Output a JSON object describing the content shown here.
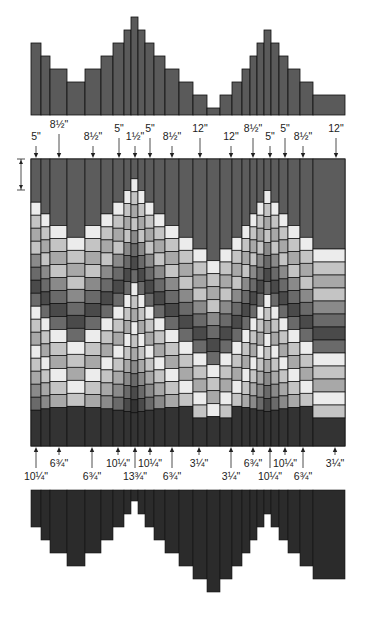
{
  "diagram": {
    "type": "quilt-strip-piecing-pattern",
    "colors": {
      "top_bars": "#5a5a5a",
      "bottom_bars": "#2b2b2b",
      "outline": "#111111",
      "shades": [
        "#ececec",
        "#c4c4c4",
        "#a8a8a8",
        "#8a8a8a",
        "#6a6a6a",
        "#4a4a4a",
        "#333333"
      ]
    },
    "columns": [
      {
        "x": 31,
        "w": 10
      },
      {
        "x": 41,
        "w": 9
      },
      {
        "x": 50,
        "w": 17
      },
      {
        "x": 67,
        "w": 18
      },
      {
        "x": 85,
        "w": 16
      },
      {
        "x": 101,
        "w": 12
      },
      {
        "x": 113,
        "w": 11
      },
      {
        "x": 124,
        "w": 7
      },
      {
        "x": 131,
        "w": 7
      },
      {
        "x": 138,
        "w": 7
      },
      {
        "x": 145,
        "w": 9
      },
      {
        "x": 154,
        "w": 11
      },
      {
        "x": 165,
        "w": 14
      },
      {
        "x": 179,
        "w": 14
      },
      {
        "x": 193,
        "w": 14
      },
      {
        "x": 207,
        "w": 13
      },
      {
        "x": 220,
        "w": 12
      },
      {
        "x": 232,
        "w": 10
      },
      {
        "x": 242,
        "w": 8
      },
      {
        "x": 250,
        "w": 7
      },
      {
        "x": 257,
        "w": 7
      },
      {
        "x": 264,
        "w": 7
      },
      {
        "x": 271,
        "w": 8
      },
      {
        "x": 279,
        "w": 9
      },
      {
        "x": 288,
        "w": 12
      },
      {
        "x": 300,
        "w": 13
      },
      {
        "x": 313,
        "w": 32
      }
    ],
    "top_bar_tops": [
      43,
      56,
      69,
      82,
      69,
      56,
      43,
      30,
      17,
      30,
      43,
      56,
      69,
      82,
      95,
      108,
      95,
      82,
      69,
      56,
      43,
      30,
      43,
      56,
      69,
      82,
      95
    ],
    "bottom_bar_bottoms": [
      527,
      540,
      553,
      566,
      553,
      540,
      527,
      514,
      501,
      514,
      527,
      540,
      553,
      566,
      579,
      592,
      579,
      566,
      553,
      540,
      527,
      514,
      527,
      540,
      553,
      566,
      579
    ],
    "top_labels": [
      {
        "text": "5\"",
        "x": 36,
        "y": 140,
        "arrow_x": 36,
        "arrow_top": 146
      },
      {
        "text": "8½\"",
        "x": 59,
        "y": 128,
        "arrow_x": 59,
        "arrow_top": 134
      },
      {
        "text": "8½\"",
        "x": 93,
        "y": 140,
        "arrow_x": 93,
        "arrow_top": 146
      },
      {
        "text": "5\"",
        "x": 119,
        "y": 132,
        "arrow_x": 119,
        "arrow_top": 138
      },
      {
        "text": "1½\"",
        "x": 135,
        "y": 140,
        "arrow_x": 135,
        "arrow_top": 146
      },
      {
        "text": "5\"",
        "x": 150,
        "y": 132,
        "arrow_x": 150,
        "arrow_top": 138
      },
      {
        "text": "8½\"",
        "x": 172,
        "y": 140,
        "arrow_x": 172,
        "arrow_top": 146
      },
      {
        "text": "12\"",
        "x": 200,
        "y": 132,
        "arrow_x": 200,
        "arrow_top": 138
      },
      {
        "text": "12\"",
        "x": 231,
        "y": 140,
        "arrow_x": 231,
        "arrow_top": 146
      },
      {
        "text": "8½\"",
        "x": 253,
        "y": 132,
        "arrow_x": 253,
        "arrow_top": 138
      },
      {
        "text": "5\"",
        "x": 270,
        "y": 140,
        "arrow_x": 270,
        "arrow_top": 146
      },
      {
        "text": "5\"",
        "x": 285,
        "y": 132,
        "arrow_x": 285,
        "arrow_top": 138
      },
      {
        "text": "8½\"",
        "x": 303,
        "y": 140,
        "arrow_x": 303,
        "arrow_top": 146
      },
      {
        "text": "12\"",
        "x": 336,
        "y": 132,
        "arrow_x": 336,
        "arrow_top": 138
      }
    ],
    "bottom_labels": [
      {
        "text": "10¼\"",
        "x": 36,
        "y": 480,
        "arrow_x": 36,
        "arrow_bottom": 455
      },
      {
        "text": "6¾\"",
        "x": 59,
        "y": 467,
        "arrow_x": 59,
        "arrow_bottom": 455
      },
      {
        "text": "6¾\"",
        "x": 92,
        "y": 480,
        "arrow_x": 92,
        "arrow_bottom": 455
      },
      {
        "text": "10¼\"",
        "x": 118,
        "y": 467,
        "arrow_x": 118,
        "arrow_bottom": 455
      },
      {
        "text": "13¾\"",
        "x": 135,
        "y": 480,
        "arrow_x": 135,
        "arrow_bottom": 455
      },
      {
        "text": "10¼\"",
        "x": 150,
        "y": 467,
        "arrow_x": 150,
        "arrow_bottom": 455
      },
      {
        "text": "6¾\"",
        "x": 172,
        "y": 480,
        "arrow_x": 172,
        "arrow_bottom": 455
      },
      {
        "text": "3¼\"",
        "x": 199,
        "y": 467,
        "arrow_x": 199,
        "arrow_bottom": 455
      },
      {
        "text": "3¼\"",
        "x": 231,
        "y": 480,
        "arrow_x": 231,
        "arrow_bottom": 455
      },
      {
        "text": "6¾\"",
        "x": 253,
        "y": 467,
        "arrow_x": 253,
        "arrow_bottom": 455
      },
      {
        "text": "10¼\"",
        "x": 270,
        "y": 480,
        "arrow_x": 270,
        "arrow_bottom": 455
      },
      {
        "text": "10¼\"",
        "x": 285,
        "y": 467,
        "arrow_x": 285,
        "arrow_bottom": 455
      },
      {
        "text": "6¾\"",
        "x": 303,
        "y": 480,
        "arrow_x": 303,
        "arrow_bottom": 455
      },
      {
        "text": "3¼\"",
        "x": 335,
        "y": 467,
        "arrow_x": 335,
        "arrow_bottom": 455
      }
    ],
    "dimension_marker": {
      "x": 21,
      "y1": 159,
      "y2": 190
    }
  }
}
